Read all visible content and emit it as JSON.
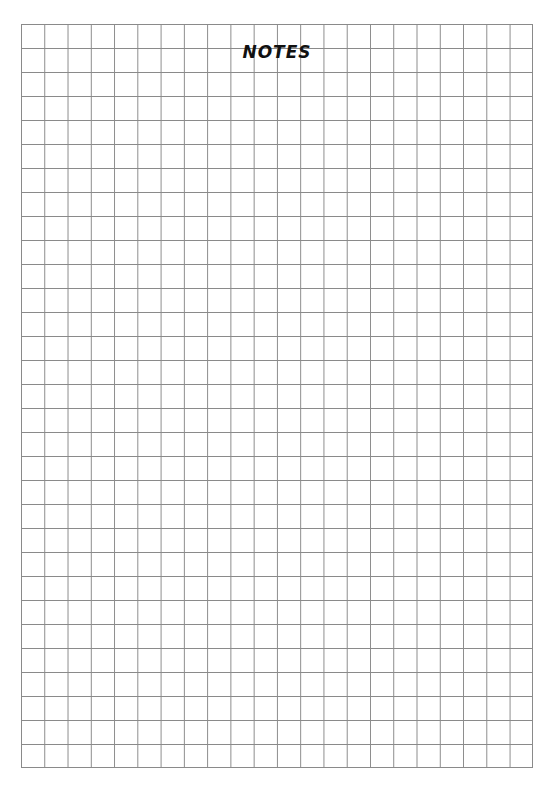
{
  "page": {
    "title": "NOTES",
    "type": "grid-paper",
    "grid": {
      "columns": 22,
      "rows": 31,
      "line_color": "#8a8a8a",
      "background": "#ffffff"
    }
  }
}
